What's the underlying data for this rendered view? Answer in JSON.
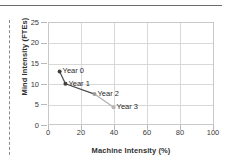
{
  "chart_data": {
    "type": "line",
    "title": "",
    "xlabel": "Machine Intensity (%)",
    "ylabel": "Mind Intensity (FTEs)",
    "xlim": [
      0,
      100
    ],
    "ylim": [
      0,
      25
    ],
    "xticks": [
      "0",
      "20",
      "40",
      "60",
      "80",
      "100"
    ],
    "yticks": [
      "0",
      "5",
      "10",
      "15",
      "20",
      "25"
    ],
    "grid": true,
    "legend": "none",
    "series": [
      {
        "name": "Transformation path",
        "points": [
          {
            "label": "Year 0",
            "x": 7.0,
            "y": 13.0,
            "color": "#3f3f3f"
          },
          {
            "label": "Year 1",
            "x": 10.5,
            "y": 10.0,
            "color": "#3f3f3f"
          },
          {
            "label": "Year 2",
            "x": 28.0,
            "y": 7.5,
            "color": "#9a9a9a"
          },
          {
            "label": "Year 3",
            "x": 39.5,
            "y": 4.3,
            "color": "#b4b4b4"
          }
        ]
      }
    ],
    "point_labels": [
      "Year 0",
      "Year 1",
      "Year 2",
      "Year 3"
    ],
    "colors": {
      "line_dark": "#4a4a4a",
      "line_light": "#b0b0b0",
      "grid": "#d8d8d8",
      "frame": "#c9c9c9",
      "text": "#3a3a3a",
      "rule": "#6d6d6d",
      "dash": "#8a8a8a"
    }
  }
}
